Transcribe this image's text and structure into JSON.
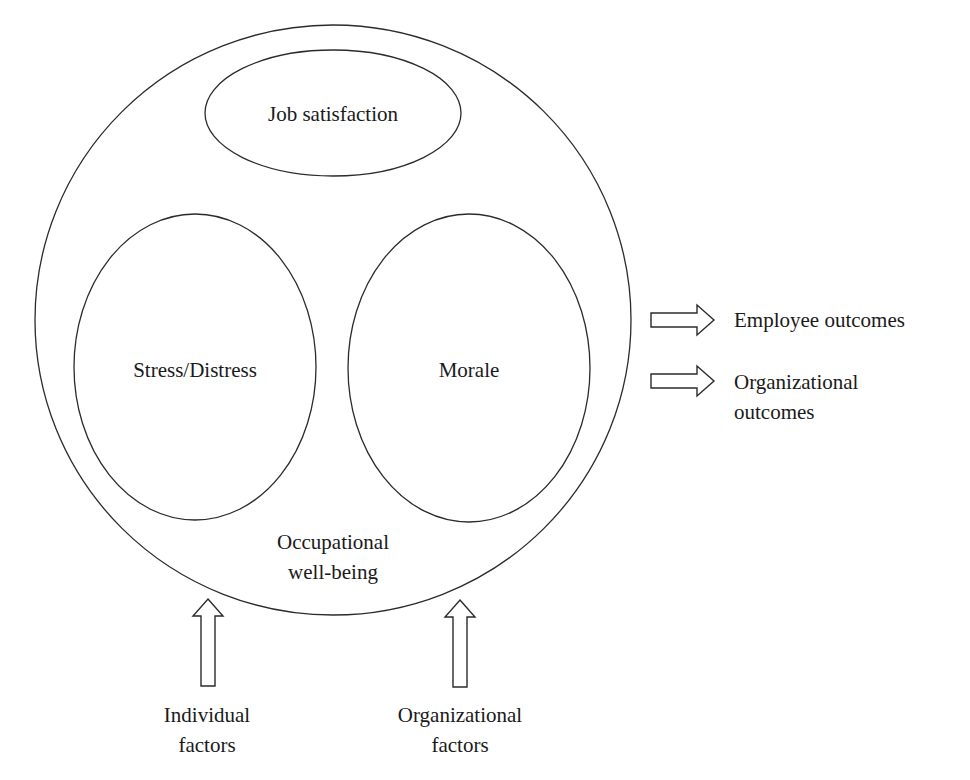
{
  "diagram": {
    "title": "Occupational well-being",
    "container": {
      "label_line1": "Occupational",
      "label_line2": "well-being"
    },
    "components": [
      {
        "id": "job-satisfaction",
        "label": "Job satisfaction"
      },
      {
        "id": "stress-distress",
        "label": "Stress/Distress"
      },
      {
        "id": "morale",
        "label": "Morale"
      }
    ],
    "inputs": [
      {
        "id": "individual-factors",
        "line1": "Individual",
        "line2": "factors"
      },
      {
        "id": "organizational-factors",
        "line1": "Organizational",
        "line2": "factors"
      }
    ],
    "outputs": [
      {
        "id": "employee-outcomes",
        "line1": "Employee outcomes",
        "line2": ""
      },
      {
        "id": "organizational-outcomes",
        "line1": "Organizational",
        "line2": "outcomes"
      }
    ],
    "colors": {
      "stroke": "#2b2b2b",
      "text": "#1a1a1a",
      "background": "#ffffff"
    }
  }
}
